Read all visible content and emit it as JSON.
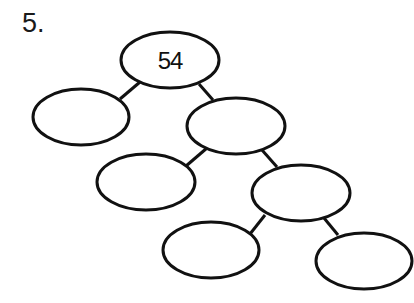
{
  "problem": {
    "number": "5."
  },
  "factor_tree": {
    "root": {
      "value": "54"
    },
    "nodes": [
      {
        "id": "root",
        "label": "54",
        "cx": 170,
        "cy": 60,
        "rx": 50,
        "ry": 28
      },
      {
        "id": "l1",
        "label": "",
        "cx": 81,
        "cy": 117,
        "rx": 49,
        "ry": 28
      },
      {
        "id": "r1",
        "label": "",
        "cx": 236,
        "cy": 126,
        "rx": 50,
        "ry": 28
      },
      {
        "id": "l2",
        "label": "",
        "cx": 146,
        "cy": 183,
        "rx": 50,
        "ry": 28
      },
      {
        "id": "r2",
        "label": "",
        "cx": 301,
        "cy": 193,
        "rx": 49,
        "ry": 28
      },
      {
        "id": "l3",
        "label": "",
        "cx": 211,
        "cy": 250,
        "rx": 49,
        "ry": 28
      },
      {
        "id": "r3",
        "label": "",
        "cx": 364,
        "cy": 260,
        "rx": 49,
        "ry": 28
      }
    ],
    "edges": [
      [
        "root",
        "l1"
      ],
      [
        "root",
        "r1"
      ],
      [
        "r1",
        "l2"
      ],
      [
        "r1",
        "r2"
      ],
      [
        "r2",
        "l3"
      ],
      [
        "r2",
        "r3"
      ]
    ]
  }
}
